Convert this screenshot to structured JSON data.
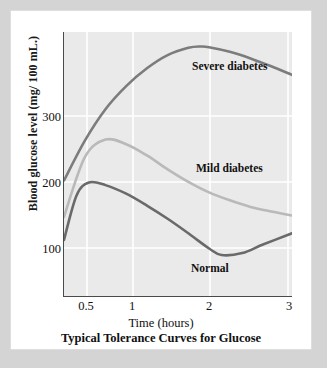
{
  "figure": {
    "caption": "Typical Tolerance Curves for Glucose",
    "background_color": "#d4d4d4",
    "card_color": "#ffffff",
    "plot_bg_color": "#eaeaea",
    "gridline_color": "#ffffff",
    "axis_color": "#4a4a4a"
  },
  "chart_data": {
    "type": "line",
    "title": "Typical Tolerance Curves for Glucose",
    "xlabel": "Time (hours)",
    "ylabel": "Blood glucose level (mg/ 100 mL.)",
    "xlim": [
      0.25,
      3
    ],
    "ylim": [
      0,
      400
    ],
    "xticks": [
      "0.5",
      "1",
      "2",
      "3"
    ],
    "xtick_values": [
      0.5,
      1,
      2,
      3
    ],
    "yticks": [
      "100",
      "200",
      "300"
    ],
    "ytick_values": [
      100,
      200,
      300
    ],
    "grid": true,
    "grid_axis": "both",
    "legend": "inline-labels",
    "series": [
      {
        "name": "Severe diabetes",
        "color": "#7c7c7c",
        "label_text": "Severe diabetes",
        "x": [
          0.25,
          0.5,
          0.75,
          1.0,
          1.25,
          1.5,
          1.75,
          1.9,
          2.0,
          2.25,
          2.5,
          2.75,
          3.0
        ],
        "y": [
          175,
          235,
          283,
          318,
          345,
          365,
          376,
          378,
          377,
          370,
          360,
          348,
          335
        ]
      },
      {
        "name": "Mild diabetes",
        "color": "#b9b9b9",
        "label_text": "Mild diabetes",
        "x": [
          0.25,
          0.5,
          0.75,
          1.0,
          1.25,
          1.5,
          1.75,
          2.0,
          2.25,
          2.5,
          2.75,
          3.0
        ],
        "y": [
          120,
          210,
          237,
          230,
          213,
          192,
          173,
          157,
          145,
          135,
          128,
          122
        ]
      },
      {
        "name": "Normal",
        "color": "#6a6a6a",
        "label_text": "Normal",
        "x": [
          0.25,
          0.4,
          0.55,
          0.75,
          1.0,
          1.25,
          1.5,
          1.75,
          2.0,
          2.15,
          2.4,
          2.65,
          3.0
        ],
        "y": [
          85,
          152,
          172,
          168,
          155,
          137,
          117,
          95,
          72,
          62,
          65,
          78,
          95
        ]
      }
    ]
  },
  "axis_titles": {
    "y": "Blood glucose level (mg/ 100 mL.)",
    "x": "Time (hours)"
  }
}
